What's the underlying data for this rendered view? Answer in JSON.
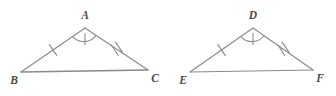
{
  "figure": {
    "background_color": "#ffffff",
    "stroke_color": "#8a8a8a",
    "label_color": "#4a4a4a"
  },
  "triangles": [
    {
      "name": "triangle-abc",
      "vertices": [
        {
          "label": "A",
          "role": "apex",
          "x": 85,
          "y": 28,
          "label_x": 85,
          "label_y": 19
        },
        {
          "label": "B",
          "role": "base-left",
          "x": 21,
          "y": 72,
          "label_x": 14,
          "label_y": 84
        },
        {
          "label": "C",
          "role": "base-right",
          "x": 148,
          "y": 70,
          "label_x": 155,
          "label_y": 82
        }
      ],
      "sides": [
        {
          "name": "side-ab",
          "from": "A",
          "to": "B",
          "ticks": 1
        },
        {
          "name": "side-ac",
          "from": "A",
          "to": "C",
          "ticks": 2
        },
        {
          "name": "side-bc",
          "from": "B",
          "to": "C",
          "ticks": 0
        }
      ],
      "angle_marks": [
        {
          "name": "angle-a",
          "vertex": "A",
          "arcs": 1,
          "tick": true
        }
      ]
    },
    {
      "name": "triangle-def",
      "vertices": [
        {
          "label": "D",
          "role": "apex",
          "x": 253,
          "y": 28,
          "label_x": 253,
          "label_y": 19
        },
        {
          "label": "E",
          "role": "base-left",
          "x": 190,
          "y": 72,
          "label_x": 183,
          "label_y": 84
        },
        {
          "label": "F",
          "role": "base-right",
          "x": 313,
          "y": 70,
          "label_x": 320,
          "label_y": 82
        }
      ],
      "sides": [
        {
          "name": "side-de",
          "from": "D",
          "to": "E",
          "ticks": 1
        },
        {
          "name": "side-df",
          "from": "D",
          "to": "F",
          "ticks": 2
        },
        {
          "name": "side-ef",
          "from": "E",
          "to": "F",
          "ticks": 0
        }
      ],
      "angle_marks": [
        {
          "name": "angle-d",
          "vertex": "D",
          "arcs": 1,
          "tick": true
        }
      ]
    }
  ],
  "labels": {
    "a": "A",
    "b": "B",
    "c": "C",
    "d": "D",
    "e": "E",
    "f": "F"
  }
}
